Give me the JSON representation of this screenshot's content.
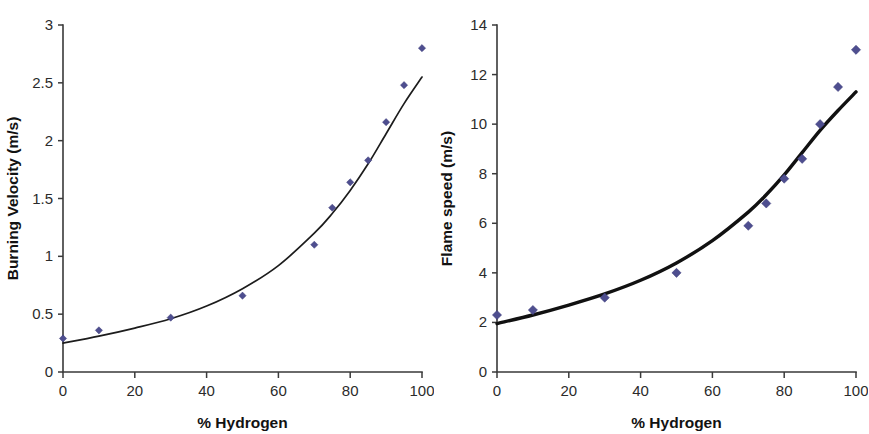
{
  "figure": {
    "panel_count": 2,
    "background_color": "#ffffff",
    "marker_color": "#4e4e8f",
    "curve_color": "#1c1c1c"
  },
  "chart_data": [
    {
      "type": "scatter",
      "panel": "left",
      "title": "",
      "xlabel": "% Hydrogen",
      "ylabel": "Burning Velocity (m/s)",
      "xlim": [
        0,
        100
      ],
      "ylim": [
        0,
        3
      ],
      "xticks": [
        0,
        20,
        40,
        60,
        80,
        100
      ],
      "yticks": [
        0,
        0.5,
        1,
        1.5,
        2,
        2.5,
        3
      ],
      "xtick_labels": [
        "0",
        "20",
        "40",
        "60",
        "80",
        "100"
      ],
      "ytick_labels": [
        "0",
        "0.5",
        "1",
        "1.5",
        "2",
        "2.5",
        "3"
      ],
      "grid": false,
      "legend": false,
      "series": [
        {
          "name": "Burning velocity data",
          "style": "markers",
          "marker": "diamond",
          "color": "#4e4e8f",
          "x": [
            0,
            10,
            30,
            50,
            70,
            75,
            80,
            85,
            90,
            95,
            100
          ],
          "y": [
            0.29,
            0.36,
            0.47,
            0.66,
            1.1,
            1.42,
            1.64,
            1.83,
            2.16,
            2.48,
            2.8
          ]
        },
        {
          "name": "Fitted trend curve",
          "style": "line",
          "color": "#1c1c1c",
          "line_width": "thin",
          "x": [
            0,
            10,
            20,
            30,
            40,
            50,
            60,
            70,
            75,
            80,
            85,
            90,
            95,
            100
          ],
          "y": [
            0.25,
            0.31,
            0.38,
            0.46,
            0.57,
            0.72,
            0.92,
            1.2,
            1.37,
            1.57,
            1.8,
            2.06,
            2.32,
            2.55
          ]
        }
      ]
    },
    {
      "type": "scatter",
      "panel": "right",
      "title": "",
      "xlabel": "% Hydrogen",
      "ylabel": "Flame speed (m/s)",
      "xlim": [
        0,
        100
      ],
      "ylim": [
        0,
        14
      ],
      "xticks": [
        0,
        20,
        40,
        60,
        80,
        100
      ],
      "yticks": [
        0,
        2,
        4,
        6,
        8,
        10,
        12,
        14
      ],
      "xtick_labels": [
        "0",
        "20",
        "40",
        "60",
        "80",
        "100"
      ],
      "ytick_labels": [
        "0",
        "2",
        "4",
        "6",
        "8",
        "10",
        "12",
        "14"
      ],
      "grid": false,
      "legend": false,
      "series": [
        {
          "name": "Flame speed data",
          "style": "markers",
          "marker": "diamond",
          "color": "#4e4e8f",
          "x": [
            0,
            10,
            30,
            50,
            70,
            75,
            80,
            85,
            90,
            95,
            100
          ],
          "y": [
            2.3,
            2.5,
            3.0,
            4.0,
            5.9,
            6.8,
            7.8,
            8.6,
            10.0,
            11.5,
            13.0
          ]
        },
        {
          "name": "Fitted trend curve",
          "style": "line",
          "color": "#111111",
          "line_width": "thick",
          "x": [
            0,
            10,
            20,
            30,
            40,
            50,
            60,
            70,
            75,
            80,
            85,
            90,
            95,
            100
          ],
          "y": [
            1.95,
            2.3,
            2.7,
            3.15,
            3.7,
            4.4,
            5.3,
            6.45,
            7.15,
            7.95,
            8.85,
            9.75,
            10.55,
            11.3
          ]
        }
      ]
    }
  ]
}
